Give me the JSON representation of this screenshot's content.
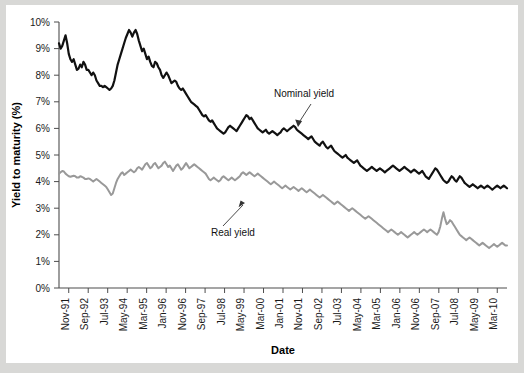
{
  "chart_data": {
    "type": "line",
    "title": "",
    "xlabel": "Date",
    "ylabel": "Yield to maturity (%)",
    "ylim": [
      0,
      10
    ],
    "ytick_labels": [
      "0%",
      "1%",
      "2%",
      "3%",
      "4%",
      "5%",
      "6%",
      "7%",
      "8%",
      "9%",
      "10%"
    ],
    "ytick_values": [
      0,
      1,
      2,
      3,
      4,
      5,
      6,
      7,
      8,
      9,
      10
    ],
    "xtick_labels": [
      "Nov-91",
      "Sep-92",
      "Jul-93",
      "May-94",
      "Mar-95",
      "Jan-96",
      "Nov-96",
      "Sep-97",
      "Jul-98",
      "May-99",
      "Mar-00",
      "Jan-01",
      "Nov-01",
      "Sep-02",
      "Jul-03",
      "May-04",
      "Mar-05",
      "Jan-06",
      "Nov-06",
      "Sep-07",
      "Jul-08",
      "May-09",
      "Mar-10"
    ],
    "grid": false,
    "legend_position": "inline-annotations",
    "annotations": [
      {
        "label": "Nominal yield",
        "x_label": "Jan-01",
        "y_value": 7.0
      },
      {
        "label": "Real yield",
        "x_label": "May-99",
        "y_value": 2.6
      }
    ],
    "series": [
      {
        "name": "Nominal yield",
        "color": "#111111",
        "width": 2.2,
        "values": [
          9.2,
          9.0,
          9.1,
          9.3,
          9.5,
          9.2,
          8.8,
          8.6,
          8.5,
          8.6,
          8.4,
          8.2,
          8.25,
          8.4,
          8.3,
          8.5,
          8.4,
          8.2,
          8.2,
          8.1,
          8.0,
          8.1,
          8.0,
          7.8,
          7.7,
          7.6,
          7.6,
          7.55,
          7.6,
          7.55,
          7.5,
          7.45,
          7.5,
          7.6,
          7.8,
          8.1,
          8.4,
          8.6,
          8.8,
          9.0,
          9.2,
          9.4,
          9.55,
          9.7,
          9.6,
          9.45,
          9.6,
          9.7,
          9.55,
          9.3,
          9.1,
          8.9,
          9.0,
          8.8,
          8.6,
          8.7,
          8.5,
          8.35,
          8.3,
          8.5,
          8.45,
          8.3,
          8.2,
          8.0,
          7.9,
          8.0,
          8.1,
          8.0,
          7.85,
          7.7,
          7.75,
          7.8,
          7.75,
          7.6,
          7.5,
          7.45,
          7.5,
          7.4,
          7.3,
          7.2,
          7.1,
          7.0,
          6.95,
          6.9,
          6.85,
          6.8,
          6.7,
          6.6,
          6.5,
          6.45,
          6.5,
          6.4,
          6.3,
          6.25,
          6.3,
          6.2,
          6.1,
          6.0,
          5.95,
          5.9,
          5.85,
          5.8,
          5.85,
          5.95,
          6.05,
          6.1,
          6.05,
          6.0,
          5.95,
          5.9,
          6.0,
          6.1,
          6.2,
          6.3,
          6.4,
          6.5,
          6.45,
          6.35,
          6.4,
          6.3,
          6.2,
          6.1,
          6.0,
          5.95,
          5.9,
          5.85,
          5.9,
          5.95,
          5.85,
          5.8,
          5.85,
          5.9,
          5.85,
          5.8,
          5.75,
          5.8,
          5.85,
          5.95,
          6.0,
          5.95,
          5.9,
          5.95,
          6.0,
          6.05,
          6.1,
          6.05,
          5.95,
          5.9,
          5.85,
          5.8,
          5.75,
          5.7,
          5.65,
          5.6,
          5.65,
          5.7,
          5.6,
          5.5,
          5.45,
          5.4,
          5.35,
          5.45,
          5.5,
          5.4,
          5.3,
          5.25,
          5.3,
          5.35,
          5.25,
          5.15,
          5.1,
          5.05,
          5.0,
          4.95,
          4.9,
          4.95,
          5.0,
          4.9,
          4.85,
          4.8,
          4.75,
          4.7,
          4.75,
          4.8,
          4.7,
          4.6,
          4.55,
          4.5,
          4.45,
          4.4,
          4.45,
          4.5,
          4.55,
          4.5,
          4.45,
          4.4,
          4.45,
          4.5,
          4.45,
          4.4,
          4.35,
          4.4,
          4.45,
          4.5,
          4.55,
          4.6,
          4.55,
          4.5,
          4.45,
          4.4,
          4.45,
          4.5,
          4.55,
          4.5,
          4.45,
          4.4,
          4.35,
          4.4,
          4.45,
          4.4,
          4.35,
          4.3,
          4.35,
          4.4,
          4.3,
          4.2,
          4.15,
          4.1,
          4.2,
          4.3,
          4.4,
          4.5,
          4.45,
          4.35,
          4.25,
          4.15,
          4.05,
          4.0,
          3.95,
          4.0,
          4.1,
          4.2,
          4.15,
          4.05,
          4.0,
          4.1,
          4.2,
          4.15,
          4.05,
          3.95,
          3.9,
          3.85,
          3.8,
          3.85,
          3.9,
          3.85,
          3.8,
          3.75,
          3.8,
          3.85,
          3.8,
          3.75,
          3.8,
          3.85,
          3.8,
          3.75,
          3.7,
          3.75,
          3.8,
          3.85,
          3.8,
          3.75,
          3.8,
          3.85,
          3.8,
          3.75
        ]
      },
      {
        "name": "Real yield",
        "color": "#999999",
        "width": 2.0,
        "values": [
          4.3,
          4.35,
          4.4,
          4.38,
          4.3,
          4.25,
          4.2,
          4.18,
          4.2,
          4.22,
          4.2,
          4.15,
          4.15,
          4.2,
          4.18,
          4.15,
          4.1,
          4.1,
          4.12,
          4.1,
          4.05,
          4.0,
          4.05,
          4.1,
          4.05,
          4.0,
          3.95,
          3.9,
          3.85,
          3.8,
          3.7,
          3.6,
          3.5,
          3.55,
          3.75,
          3.95,
          4.1,
          4.2,
          4.3,
          4.35,
          4.25,
          4.3,
          4.35,
          4.4,
          4.45,
          4.4,
          4.35,
          4.4,
          4.5,
          4.55,
          4.5,
          4.45,
          4.55,
          4.65,
          4.7,
          4.6,
          4.5,
          4.55,
          4.65,
          4.7,
          4.6,
          4.5,
          4.55,
          4.6,
          4.7,
          4.75,
          4.65,
          4.55,
          4.6,
          4.5,
          4.4,
          4.5,
          4.6,
          4.65,
          4.55,
          4.45,
          4.5,
          4.6,
          4.7,
          4.6,
          4.5,
          4.55,
          4.6,
          4.65,
          4.6,
          4.55,
          4.5,
          4.45,
          4.4,
          4.35,
          4.3,
          4.2,
          4.1,
          4.05,
          4.1,
          4.15,
          4.1,
          4.05,
          4.0,
          4.05,
          4.15,
          4.2,
          4.15,
          4.1,
          4.05,
          4.1,
          4.15,
          4.1,
          4.05,
          4.1,
          4.15,
          4.2,
          4.3,
          4.35,
          4.3,
          4.25,
          4.3,
          4.35,
          4.3,
          4.25,
          4.2,
          4.25,
          4.3,
          4.25,
          4.2,
          4.15,
          4.1,
          4.05,
          4.0,
          3.95,
          3.9,
          3.95,
          4.0,
          3.95,
          3.9,
          3.85,
          3.8,
          3.75,
          3.8,
          3.85,
          3.8,
          3.75,
          3.7,
          3.75,
          3.8,
          3.75,
          3.7,
          3.65,
          3.7,
          3.75,
          3.7,
          3.65,
          3.6,
          3.65,
          3.7,
          3.65,
          3.6,
          3.55,
          3.5,
          3.45,
          3.4,
          3.45,
          3.5,
          3.45,
          3.4,
          3.35,
          3.3,
          3.25,
          3.2,
          3.15,
          3.2,
          3.25,
          3.2,
          3.15,
          3.1,
          3.05,
          3.0,
          2.95,
          2.9,
          2.95,
          3.0,
          2.95,
          2.9,
          2.85,
          2.8,
          2.75,
          2.7,
          2.65,
          2.6,
          2.65,
          2.7,
          2.65,
          2.6,
          2.55,
          2.5,
          2.45,
          2.4,
          2.35,
          2.3,
          2.25,
          2.2,
          2.15,
          2.1,
          2.15,
          2.2,
          2.15,
          2.1,
          2.05,
          2.0,
          2.05,
          2.1,
          2.05,
          2.0,
          1.95,
          1.9,
          1.95,
          2.0,
          2.05,
          2.1,
          2.05,
          2.0,
          2.05,
          2.1,
          2.15,
          2.2,
          2.15,
          2.1,
          2.15,
          2.2,
          2.15,
          2.1,
          2.05,
          2.0,
          2.1,
          2.3,
          2.6,
          2.85,
          2.6,
          2.4,
          2.45,
          2.55,
          2.5,
          2.4,
          2.3,
          2.2,
          2.1,
          2.0,
          1.95,
          1.9,
          1.85,
          1.8,
          1.85,
          1.9,
          1.85,
          1.8,
          1.75,
          1.7,
          1.65,
          1.6,
          1.65,
          1.7,
          1.65,
          1.6,
          1.55,
          1.5,
          1.55,
          1.6,
          1.65,
          1.6,
          1.55,
          1.6,
          1.65,
          1.7,
          1.65,
          1.6,
          1.6
        ]
      }
    ]
  }
}
